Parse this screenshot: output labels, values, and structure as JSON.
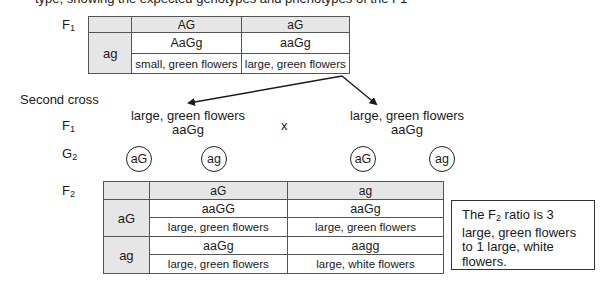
{
  "cutoff_line": "type, showing the expected genotypes and phenotypes of the F1",
  "first_cross": {
    "generation_label": "F",
    "generation_sub": "1",
    "columns": [
      "AG",
      "aG"
    ],
    "row_gamete": "ag",
    "cells": [
      {
        "genotype": "AaGg",
        "phenotype": "small, green flowers"
      },
      {
        "genotype": "aaGg",
        "phenotype": "large, green flowers"
      }
    ]
  },
  "second_cross": {
    "title": "Second cross",
    "f1_label": "F",
    "f1_sub": "1",
    "parents": [
      {
        "phenotype": "large, green flowers",
        "genotype": "aaGg"
      },
      {
        "phenotype": "large, green flowers",
        "genotype": "aaGg"
      }
    ],
    "cross_symbol": "x",
    "gametes_label": "G",
    "gametes_sub": "2",
    "gametes": [
      "aG",
      "ag",
      "aG",
      "ag"
    ]
  },
  "f2": {
    "generation_label": "F",
    "generation_sub": "2",
    "columns": [
      "aG",
      "ag"
    ],
    "rows": [
      {
        "gamete": "aG",
        "cells": [
          {
            "genotype": "aaGG",
            "phenotype": "large, green flowers"
          },
          {
            "genotype": "aaGg",
            "phenotype": "large, green flowers"
          }
        ]
      },
      {
        "gamete": "ag",
        "cells": [
          {
            "genotype": "aaGg",
            "phenotype": "large, green flowers"
          },
          {
            "genotype": "aagg",
            "phenotype": "large, white flowers"
          }
        ]
      }
    ]
  },
  "ratio_note": {
    "prefix": "The F",
    "sub": "2",
    "text": " ratio is 3 large, green flowers to 1 large, white flowers."
  },
  "colors": {
    "header_fill": "#e6e6e6",
    "border": "#555555",
    "text": "#1a1a1a"
  }
}
